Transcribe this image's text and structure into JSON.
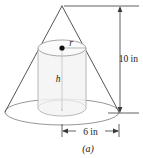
{
  "figure": {
    "caption": "(a)",
    "shapes": {
      "cone_label": "cone",
      "cylinder_label": "inscribed cylinder"
    },
    "labels": {
      "height_dimension": "10 in",
      "diameter_dimension": "6 in",
      "radius_variable": "r",
      "height_variable": "h"
    },
    "colors": {
      "outline": "#6b6b6b",
      "cone_outline": "#5a5a5a",
      "cylinder_fill": "#f4f4f4",
      "cylinder_outline": "#b5b5b5",
      "dimension_line": "#3a3a3a",
      "center_dot": "#111111",
      "background": "#ffffff"
    },
    "geometry": {
      "cone_apex_x": 62,
      "cone_apex_y": 6,
      "cone_base_center_x": 62,
      "cone_base_center_y": 112,
      "cone_base_rx": 57,
      "cone_base_ry": 13,
      "cylinder_center_x": 62,
      "cylinder_top_y": 48,
      "cylinder_bottom_y": 108,
      "cylinder_rx": 24,
      "cylinder_ry": 8,
      "dimension_vertical_x": 120,
      "dimension_horizontal_y": 131
    }
  }
}
